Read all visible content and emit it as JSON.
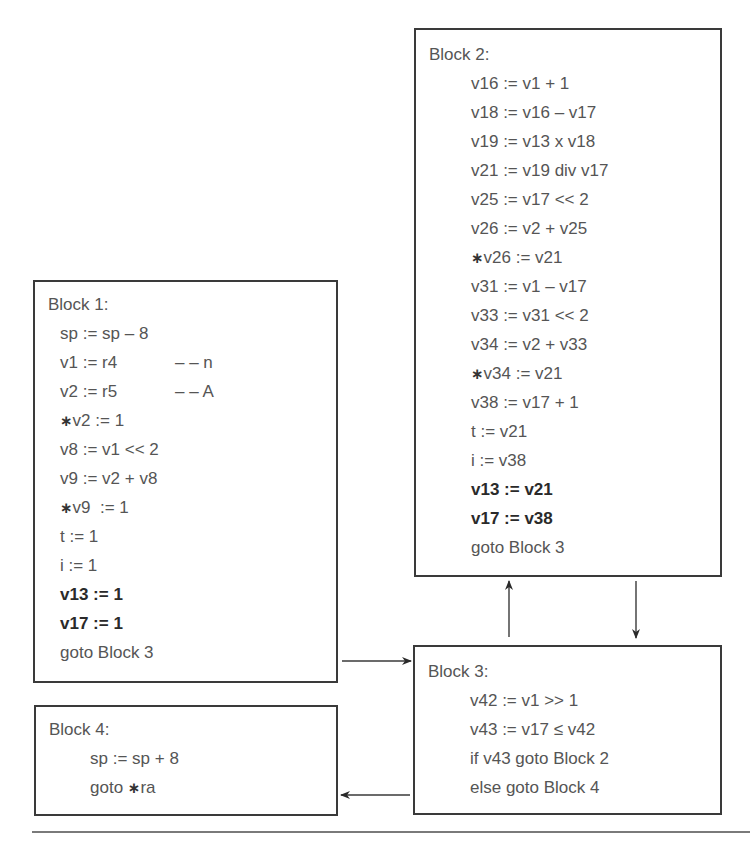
{
  "diagram": {
    "type": "control-flow-graph",
    "blocks": [
      {
        "id": "block1",
        "title": "Block 1:",
        "lines": [
          {
            "text": "sp := sp – 8",
            "bold": false,
            "star": false
          },
          {
            "text": "v1 := r4",
            "comment": "– – n",
            "bold": false,
            "star": false
          },
          {
            "text": "v2 := r5",
            "comment": "– – A",
            "bold": false,
            "star": false
          },
          {
            "text": "v2 := 1",
            "bold": false,
            "star": true
          },
          {
            "text": "v8 := v1 << 2",
            "bold": false,
            "star": false
          },
          {
            "text": "v9 := v2 + v8",
            "bold": false,
            "star": false
          },
          {
            "text": "v9  := 1",
            "bold": false,
            "star": true
          },
          {
            "text": "t := 1",
            "bold": false,
            "star": false
          },
          {
            "text": "i := 1",
            "bold": false,
            "star": false
          },
          {
            "text": "v13 := 1",
            "bold": true,
            "star": false
          },
          {
            "text": "v17 := 1",
            "bold": true,
            "star": false
          },
          {
            "text": "goto Block 3",
            "bold": false,
            "star": false
          }
        ]
      },
      {
        "id": "block2",
        "title": "Block 2:",
        "lines": [
          {
            "text": "v16 := v1 + 1",
            "bold": false,
            "star": false
          },
          {
            "text": "v18 := v16 – v17",
            "bold": false,
            "star": false
          },
          {
            "text": "v19 := v13 x v18",
            "bold": false,
            "star": false
          },
          {
            "text": "v21 := v19 div v17",
            "bold": false,
            "star": false
          },
          {
            "text": "v25 := v17 << 2",
            "bold": false,
            "star": false
          },
          {
            "text": "v26 := v2 + v25",
            "bold": false,
            "star": false
          },
          {
            "text": "v26 := v21",
            "bold": false,
            "star": true
          },
          {
            "text": "v31 := v1 – v17",
            "bold": false,
            "star": false
          },
          {
            "text": "v33 := v31 << 2",
            "bold": false,
            "star": false
          },
          {
            "text": "v34 := v2 + v33",
            "bold": false,
            "star": false
          },
          {
            "text": "v34 := v21",
            "bold": false,
            "star": true
          },
          {
            "text": "v38 := v17 + 1",
            "bold": false,
            "star": false
          },
          {
            "text": "t := v21",
            "bold": false,
            "star": false
          },
          {
            "text": "i := v38",
            "bold": false,
            "star": false
          },
          {
            "text": "v13 := v21",
            "bold": true,
            "star": false
          },
          {
            "text": "v17 := v38",
            "bold": true,
            "star": false
          },
          {
            "text": "goto Block 3",
            "bold": false,
            "star": false
          }
        ]
      },
      {
        "id": "block3",
        "title": "Block 3:",
        "lines": [
          {
            "text": "v42 := v1 >> 1",
            "bold": false,
            "star": false
          },
          {
            "text": "v43 := v17 ≤ v42",
            "bold": false,
            "star": false
          },
          {
            "text": "if v43 goto Block 2",
            "bold": false,
            "star": false
          },
          {
            "text": "else goto Block 4",
            "bold": false,
            "star": false
          }
        ]
      },
      {
        "id": "block4",
        "title": "Block 4:",
        "lines": [
          {
            "text": "sp := sp + 8",
            "bold": false,
            "star": false
          },
          {
            "text": "goto ",
            "suffix_star": "ra",
            "bold": false,
            "star": false
          }
        ]
      }
    ],
    "edges": [
      {
        "from": "Block 1",
        "to": "Block 3"
      },
      {
        "from": "Block 3",
        "to": "Block 2"
      },
      {
        "from": "Block 2",
        "to": "Block 3"
      },
      {
        "from": "Block 3",
        "to": "Block 4"
      }
    ],
    "star_glyph": "∗",
    "colors": {
      "border": "#3a3a3a",
      "text": "#555555",
      "rule": "#7a7a7a"
    }
  }
}
